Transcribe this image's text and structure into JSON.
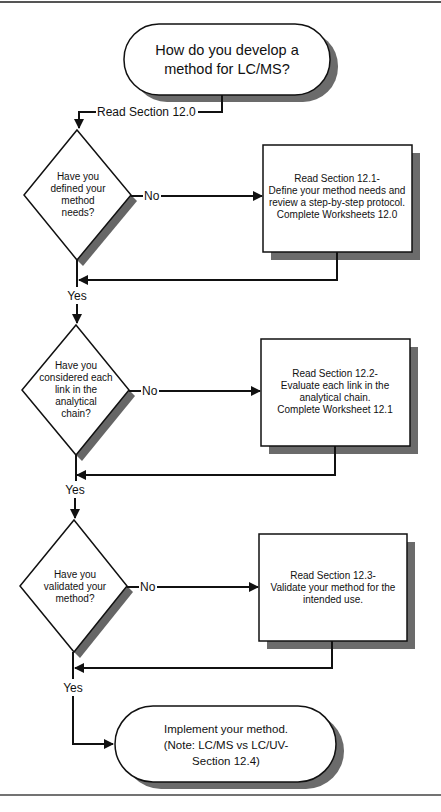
{
  "colors": {
    "line": "#111111",
    "shadow": "#6b6b6b",
    "fill": "#ffffff",
    "rule": "#444444"
  },
  "start": {
    "lines": [
      "How do you develop a",
      "method for LC/MS?"
    ]
  },
  "start_connector_label": "Read Section 12.0",
  "decisions": [
    {
      "lines": [
        "Have you",
        "defined your",
        "method",
        "needs?"
      ],
      "no_label": "No",
      "yes_label": "Yes"
    },
    {
      "lines": [
        "Have you",
        "considered each",
        "link in the",
        "analytical",
        "chain?"
      ],
      "no_label": "No",
      "yes_label": "Yes"
    },
    {
      "lines": [
        "Have you",
        "validated your",
        "method?"
      ],
      "no_label": "No",
      "yes_label": "Yes"
    }
  ],
  "actions": [
    {
      "lines": [
        "Read Section 12.1-",
        "Define your method needs and",
        "review a step-by-step protocol.",
        "Complete Worksheets 12.0"
      ]
    },
    {
      "lines": [
        "Read Section 12.2-",
        "Evaluate each link in the",
        "analytical chain.",
        "Complete Worksheet 12.1"
      ]
    },
    {
      "lines": [
        "Read Section 12.3-",
        "Validate your method for the",
        "intended use."
      ]
    }
  ],
  "end": {
    "lines": [
      "Implement your method.",
      "(Note: LC/MS vs LC/UV-",
      "Section 12.4)"
    ]
  }
}
